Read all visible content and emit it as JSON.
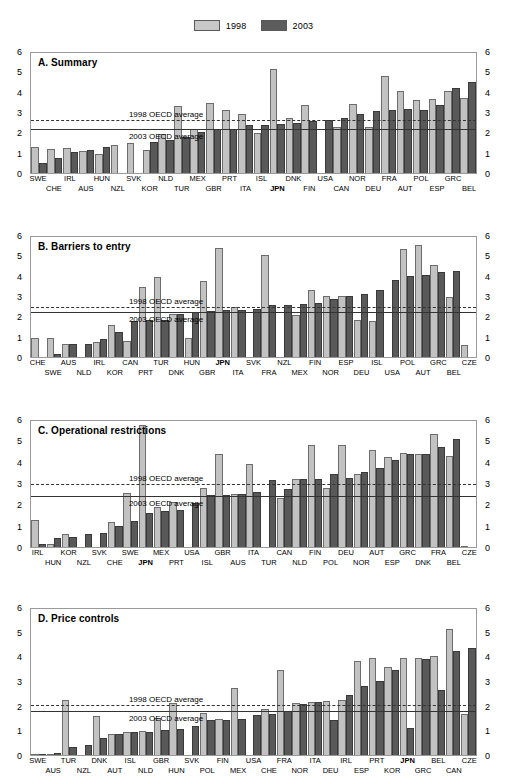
{
  "legend": {
    "items": [
      {
        "label": "1998",
        "color": "#c8c8c8",
        "name": "legend-1998"
      },
      {
        "label": "2003",
        "color": "#5c5c5c",
        "name": "legend-2003"
      }
    ]
  },
  "axis": {
    "ticks": [
      "6",
      "5",
      "4",
      "3",
      "2",
      "1",
      "0"
    ],
    "ylim": [
      0,
      6
    ]
  },
  "reference_labels": {
    "avg1998": "1998 OECD average",
    "avg2003": "2003 OECD average"
  },
  "chart_data": [
    {
      "type": "bar",
      "title": "A. Summary",
      "xlabel": "",
      "ylabel": "",
      "ylim": [
        0,
        6
      ],
      "grid": false,
      "legend_position": "top-center",
      "avg_1998": 2.7,
      "avg_2003": 2.25,
      "categories": [
        "SWE",
        "CHE",
        "IRL",
        "AUS",
        "HUN",
        "NZL",
        "SVK",
        "KOR",
        "NLD",
        "TUR",
        "MEX",
        "GBR",
        "PRT",
        "ITA",
        "ISL",
        "JPN",
        "DNK",
        "FIN",
        "USA",
        "CAN",
        "NOR",
        "DEU",
        "FRA",
        "AUT",
        "POL",
        "ESP",
        "GRC",
        "BEL"
      ],
      "bold_categories": [
        "JPN"
      ],
      "series": [
        {
          "name": "1998",
          "values": [
            1.3,
            1.2,
            1.25,
            1.1,
            0.95,
            1.4,
            1.48,
            1.12,
            1.92,
            3.28,
            2.15,
            3.42,
            3.1,
            2.9,
            1.98,
            5.13,
            2.72,
            3.35,
            0.0,
            2.28,
            3.38,
            2.25,
            4.75,
            4.05,
            3.58,
            3.65,
            4.03,
            3.7
          ]
        },
        {
          "name": "2003",
          "values": [
            0.5,
            0.75,
            1.02,
            1.13,
            1.28,
            0.0,
            0.0,
            1.52,
            1.62,
            1.78,
            2.02,
            2.15,
            2.15,
            2.35,
            2.38,
            2.42,
            2.48,
            2.55,
            2.6,
            2.7,
            2.92,
            3.05,
            3.12,
            3.15,
            3.12,
            3.35,
            4.18,
            4.5
          ]
        }
      ]
    },
    {
      "type": "bar",
      "title": "B. Barriers to entry",
      "xlabel": "",
      "ylabel": "",
      "ylim": [
        0,
        6
      ],
      "grid": false,
      "legend_position": "top-center",
      "avg_1998": 2.58,
      "avg_2003": 2.32,
      "categories": [
        "CHE",
        "SWE",
        "AUS",
        "NLD",
        "IRL",
        "KOR",
        "CAN",
        "PRT",
        "TUR",
        "DNK",
        "HUN",
        "GBR",
        "JPN",
        "ITA",
        "SVK",
        "FRA",
        "NZL",
        "MEX",
        "FIN",
        "NOR",
        "ESP",
        "DEU",
        "ISL",
        "USA",
        "POL",
        "AUT",
        "GRC",
        "BEL",
        "CZE"
      ],
      "bold_categories": [
        "JPN"
      ],
      "series": [
        {
          "name": "1998",
          "values": [
            0.92,
            0.95,
            0.62,
            0.0,
            0.75,
            1.58,
            0.8,
            3.42,
            3.92,
            2.12,
            0.92,
            3.75,
            5.35,
            2.48,
            0.0,
            5.0,
            0.0,
            2.08,
            3.28,
            3.02,
            3.0,
            1.82,
            1.78,
            0.0,
            5.32,
            5.52,
            4.52,
            2.95,
            0.6
          ]
        },
        {
          "name": "2003",
          "values": [
            0.0,
            0.15,
            0.62,
            0.65,
            0.88,
            1.22,
            1.78,
            1.8,
            1.82,
            2.12,
            2.22,
            2.28,
            2.3,
            2.3,
            2.35,
            2.55,
            2.58,
            2.62,
            2.65,
            2.85,
            3.0,
            3.08,
            3.28,
            3.78,
            3.98,
            4.05,
            4.2,
            4.25,
            0.0
          ]
        }
      ]
    },
    {
      "type": "bar",
      "title": "C. Operational restrictions",
      "xlabel": "",
      "ylabel": "",
      "ylim": [
        0,
        6
      ],
      "grid": false,
      "legend_position": "top-center",
      "avg_1998": 3.05,
      "avg_2003": 2.48,
      "categories": [
        "IRL",
        "HUN",
        "KOR",
        "NZL",
        "SVK",
        "CHE",
        "SWE",
        "JPN",
        "MEX",
        "PRT",
        "USA",
        "ISL",
        "GBR",
        "AUS",
        "ITA",
        "TUR",
        "CAN",
        "NLD",
        "FIN",
        "POL",
        "DEU",
        "NOR",
        "AUT",
        "ESP",
        "GRC",
        "DNK",
        "FRA",
        "BEL",
        "CZE"
      ],
      "bold_categories": [
        "JPN"
      ],
      "series": [
        {
          "name": "1998",
          "values": [
            1.28,
            0.15,
            0.62,
            0.0,
            0.0,
            1.15,
            2.55,
            5.72,
            1.88,
            2.12,
            0.0,
            2.78,
            4.35,
            2.48,
            3.88,
            0.0,
            2.32,
            3.2,
            4.8,
            2.75,
            4.78,
            3.42,
            4.55,
            4.22,
            4.42,
            4.35,
            5.28,
            4.25,
            0.05
          ]
        },
        {
          "name": "2003",
          "values": [
            0.12,
            0.42,
            0.45,
            0.62,
            0.65,
            1.0,
            1.22,
            1.58,
            1.68,
            1.72,
            2.05,
            2.42,
            2.42,
            2.48,
            2.58,
            3.12,
            2.7,
            3.18,
            3.18,
            3.42,
            3.22,
            3.5,
            3.7,
            4.08,
            4.35,
            4.35,
            4.7,
            5.08,
            0.0
          ]
        }
      ]
    },
    {
      "type": "bar",
      "title": "D. Price controls",
      "xlabel": "",
      "ylabel": "",
      "ylim": [
        0,
        6
      ],
      "grid": false,
      "legend_position": "top-center",
      "avg_1998": 2.1,
      "avg_2003": 1.88,
      "categories": [
        "SWE",
        "AUS",
        "TUR",
        "NZL",
        "DNK",
        "AUT",
        "ISL",
        "NLD",
        "GBR",
        "HUN",
        "SVK",
        "POL",
        "FIN",
        "MEX",
        "USA",
        "CHE",
        "FRA",
        "NOR",
        "ITA",
        "DEU",
        "IRL",
        "ESP",
        "PRT",
        "KOR",
        "JPN",
        "GRC",
        "BEL",
        "CAN",
        "CZE"
      ],
      "bold_categories": [
        "JPN"
      ],
      "series": [
        {
          "name": "1998",
          "values": [
            0.05,
            0.05,
            2.25,
            0.0,
            1.58,
            0.85,
            0.95,
            0.98,
            1.52,
            2.12,
            0.0,
            1.72,
            1.48,
            2.72,
            0.0,
            1.88,
            3.45,
            2.12,
            2.15,
            2.2,
            2.22,
            3.82,
            3.95,
            3.55,
            3.95,
            3.95,
            4.02,
            5.1,
            1.68
          ]
        },
        {
          "name": "2003",
          "values": [
            0.05,
            0.08,
            0.32,
            0.4,
            0.68,
            0.85,
            0.95,
            0.95,
            1.02,
            1.05,
            1.18,
            1.42,
            1.42,
            1.45,
            1.62,
            1.68,
            1.78,
            2.08,
            2.15,
            1.42,
            2.42,
            2.78,
            3.0,
            3.45,
            1.08,
            3.88,
            2.62,
            4.22,
            4.35,
            0.0
          ]
        }
      ]
    }
  ]
}
